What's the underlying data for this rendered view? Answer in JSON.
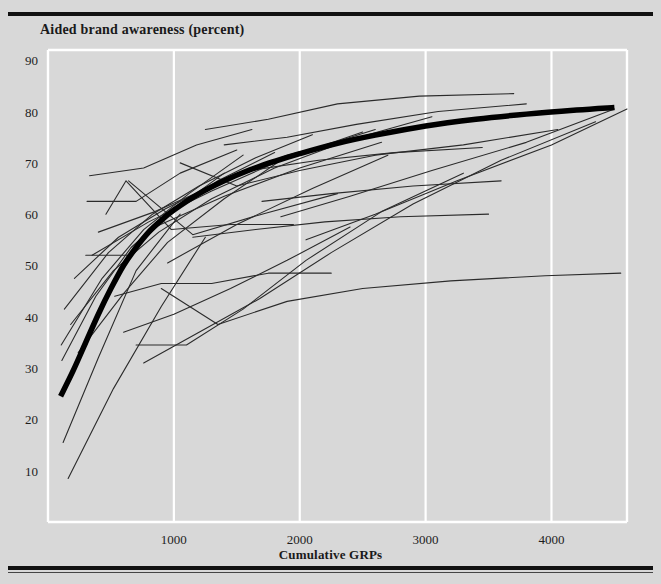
{
  "figure": {
    "background_color": "#d8d8d8",
    "rule_color": "#111111",
    "gridline_color": "#ffffff",
    "series_color": "#2b2b2b",
    "mean_curve_color": "#000000"
  },
  "chart_data": {
    "type": "line",
    "title": "Aided brand awareness (percent)",
    "xlabel": "Cumulative GRPs",
    "ylabel": "Aided brand awareness (percent)",
    "xlim": [
      0,
      4600
    ],
    "ylim": [
      0,
      92
    ],
    "grid": true,
    "grid_axis": "x",
    "legend": "none",
    "xticks": [
      1000,
      2000,
      3000,
      4000
    ],
    "xticklabels": [
      "1000",
      "2000",
      "3000",
      "4000"
    ],
    "yticks": [
      10,
      20,
      30,
      40,
      50,
      60,
      70,
      80,
      90
    ],
    "yticklabels": [
      "10",
      "20",
      "30",
      "40",
      "50",
      "60",
      "70",
      "80",
      "90"
    ],
    "series": [
      {
        "name": "Average response curve",
        "emphasis": "thick",
        "x": [
          100,
          200,
          300,
          400,
          500,
          600,
          700,
          800,
          900,
          1000,
          1200,
          1400,
          1600,
          1800,
          2000,
          2300,
          2600,
          3000,
          3400,
          3800,
          4200,
          4500
        ],
        "values": [
          24.5,
          29.5,
          35.0,
          40.5,
          45.5,
          50.0,
          53.5,
          56.5,
          58.8,
          60.8,
          64.0,
          66.5,
          68.6,
          70.3,
          71.8,
          73.8,
          75.4,
          77.2,
          78.5,
          79.5,
          80.3,
          80.8
        ]
      },
      {
        "name": "brand-01",
        "x": [
          120,
          400,
          700,
          1050
        ],
        "values": [
          15.5,
          32.0,
          49.0,
          60.0
        ]
      },
      {
        "name": "brand-02",
        "x": [
          160,
          520,
          900,
          1250
        ],
        "values": [
          8.5,
          26.0,
          42.0,
          55.5
        ]
      },
      {
        "name": "brand-03",
        "x": [
          110,
          380,
          660,
          980,
          1400
        ],
        "values": [
          31.5,
          44.0,
          53.5,
          60.5,
          68.0
        ]
      },
      {
        "name": "brand-04",
        "x": [
          105,
          430,
          760,
          1120,
          1550
        ],
        "values": [
          34.5,
          47.5,
          57.0,
          64.0,
          71.5
        ]
      },
      {
        "name": "brand-05",
        "x": [
          130,
          480,
          830,
          1200,
          1650,
          2100
        ],
        "values": [
          41.5,
          52.5,
          60.0,
          65.5,
          71.0,
          75.5
        ]
      },
      {
        "name": "brand-06",
        "x": [
          300,
          640,
          980,
          1350,
          1800
        ],
        "values": [
          52.0,
          52.0,
          60.5,
          66.5,
          72.0
        ]
      },
      {
        "name": "brand-07",
        "x": [
          310,
          700,
          1050,
          1500
        ],
        "values": [
          62.5,
          62.5,
          68.0,
          72.5
        ]
      },
      {
        "name": "brand-08",
        "x": [
          330,
          760,
          1180,
          1620
        ],
        "values": [
          67.5,
          69.0,
          73.5,
          76.5
        ]
      },
      {
        "name": "brand-09",
        "x": [
          460,
          620,
          980,
          1450,
          1950
        ],
        "values": [
          60.0,
          66.5,
          57.0,
          58.0,
          58.0
        ]
      },
      {
        "name": "brand-10",
        "x": [
          530,
          900,
          1300,
          1750,
          2250
        ],
        "values": [
          44.0,
          46.5,
          46.5,
          48.5,
          48.5
        ]
      },
      {
        "name": "brand-11",
        "x": [
          600,
          1000,
          1450,
          1900,
          2400
        ],
        "values": [
          37.0,
          40.5,
          45.5,
          51.0,
          57.5
        ]
      },
      {
        "name": "brand-12",
        "x": [
          240,
          600,
          950,
          1400,
          1850
        ],
        "values": [
          33.0,
          44.5,
          54.5,
          63.0,
          70.5
        ]
      },
      {
        "name": "brand-13",
        "x": [
          210,
          560,
          930,
          1380,
          1900,
          2450
        ],
        "values": [
          47.5,
          55.5,
          61.0,
          66.5,
          71.5,
          75.0
        ]
      },
      {
        "name": "brand-14",
        "x": [
          180,
          520,
          880,
          1300,
          1800,
          2400,
          3050
        ],
        "values": [
          38.5,
          49.0,
          56.5,
          63.0,
          69.0,
          74.5,
          79.0
        ]
      },
      {
        "name": "brand-15",
        "x": [
          700,
          1100,
          1550,
          2050,
          2650,
          3300
        ],
        "values": [
          34.5,
          34.5,
          41.5,
          51.0,
          60.5,
          68.0
        ]
      },
      {
        "name": "brand-16",
        "x": [
          760,
          1200,
          1680,
          2250,
          2900,
          3600,
          4350
        ],
        "values": [
          31.0,
          37.0,
          43.5,
          52.5,
          62.0,
          70.5,
          78.0
        ]
      },
      {
        "name": "brand-17",
        "x": [
          900,
          1350,
          1900,
          2500,
          3200,
          3950,
          4550
        ],
        "values": [
          45.5,
          38.5,
          43.0,
          45.5,
          47.0,
          48.0,
          48.5
        ]
      },
      {
        "name": "brand-18",
        "x": [
          1050,
          1500,
          2000,
          2600,
          3300,
          4050
        ],
        "values": [
          70.0,
          65.5,
          68.5,
          71.5,
          73.5,
          76.5
        ]
      },
      {
        "name": "brand-19",
        "x": [
          1250,
          1750,
          2300,
          2950,
          3700
        ],
        "values": [
          76.5,
          78.5,
          81.5,
          83.0,
          83.5
        ]
      },
      {
        "name": "brand-20",
        "x": [
          1400,
          1900,
          2450,
          3100,
          3800
        ],
        "values": [
          73.5,
          75.0,
          77.5,
          80.0,
          81.5
        ]
      },
      {
        "name": "brand-21",
        "x": [
          1600,
          2150,
          2750,
          3450
        ],
        "values": [
          68.5,
          70.5,
          72.0,
          73.0
        ]
      },
      {
        "name": "brand-22",
        "x": [
          1700,
          2250,
          2900,
          3600
        ],
        "values": [
          62.5,
          64.0,
          65.5,
          66.5
        ]
      },
      {
        "name": "brand-23",
        "x": [
          1850,
          2400,
          3050,
          3800,
          4500
        ],
        "values": [
          59.5,
          63.5,
          68.5,
          74.0,
          80.5
        ]
      },
      {
        "name": "brand-24",
        "x": [
          2050,
          2600,
          3250,
          4000,
          4600
        ],
        "values": [
          55.0,
          60.0,
          66.5,
          73.5,
          80.5
        ]
      },
      {
        "name": "brand-25",
        "x": [
          1150,
          1650,
          2200,
          2800,
          3500
        ],
        "values": [
          55.5,
          57.0,
          58.5,
          59.5,
          60.0
        ]
      },
      {
        "name": "brand-26",
        "x": [
          950,
          1500,
          2100,
          2700
        ],
        "values": [
          50.5,
          58.0,
          65.0,
          71.5
        ]
      },
      {
        "name": "brand-27",
        "x": [
          850,
          1400,
          2000,
          2650
        ],
        "values": [
          57.5,
          63.5,
          69.0,
          74.0
        ]
      },
      {
        "name": "brand-28",
        "x": [
          640,
          1150,
          1700,
          2300
        ],
        "values": [
          66.5,
          56.0,
          60.0,
          64.0
        ]
      },
      {
        "name": "brand-29",
        "x": [
          400,
          850,
          1350,
          1950,
          2600
        ],
        "values": [
          56.5,
          60.5,
          66.0,
          71.5,
          76.5
        ]
      },
      {
        "name": "brand-30",
        "x": [
          350,
          800,
          1300,
          1850,
          2500
        ],
        "values": [
          52.0,
          58.5,
          64.5,
          70.5,
          76.0
        ]
      }
    ]
  }
}
